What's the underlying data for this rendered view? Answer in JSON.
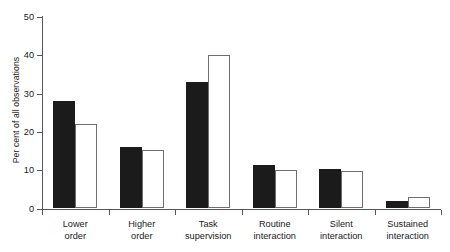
{
  "chart_data": {
    "type": "bar",
    "title": "",
    "subtitle": "",
    "xlabel": "",
    "ylabel": "Per cent of all observations",
    "ylim": [
      0,
      50
    ],
    "yticks": [
      0,
      10,
      20,
      30,
      40,
      50
    ],
    "ytick_labels": [
      "0",
      "10",
      "20",
      "30",
      "40",
      "50"
    ],
    "grid": false,
    "legend_position": "none",
    "categories": [
      "Lower order",
      "Higher order",
      "Task supervision",
      "Routine interaction",
      "Silent interaction",
      "Sustained interaction"
    ],
    "category_lines": [
      [
        "Lower",
        "order"
      ],
      [
        "Higher",
        "order"
      ],
      [
        "Task",
        "supervision"
      ],
      [
        "Routine",
        "interaction"
      ],
      [
        "Silent",
        "interaction"
      ],
      [
        "Sustained",
        "interaction"
      ]
    ],
    "series": [
      {
        "name": "filled",
        "style": "solid-black",
        "color": "#1b1b1b",
        "values": [
          28,
          16,
          33,
          11.3,
          10.2,
          2
        ]
      },
      {
        "name": "open",
        "style": "open-white",
        "color": "#ffffff",
        "edge_color": "#6d6e71",
        "values": [
          22,
          15.2,
          40,
          10,
          9.7,
          3
        ]
      }
    ]
  },
  "axes": {
    "axis_color": "#55565a",
    "tick_label_color": "#1a1a1a"
  }
}
